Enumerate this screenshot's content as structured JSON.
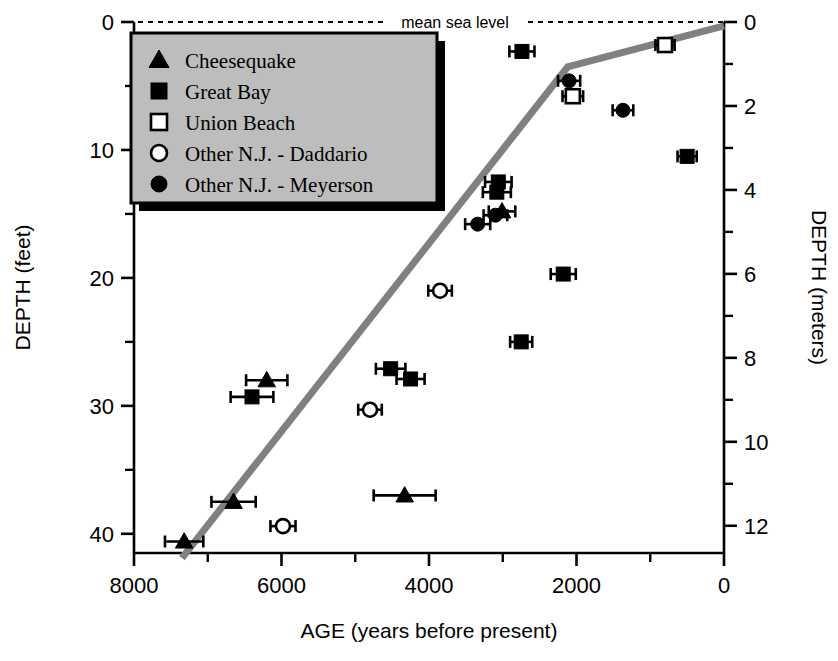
{
  "chart_data": {
    "type": "scatter",
    "title": "",
    "xlabel": "AGE (years before present)",
    "ylabel": "DEPTH (feet)",
    "ylabel_right": "DEPTH (meters)",
    "xlim": [
      8000,
      0
    ],
    "ylim": [
      0,
      41.5
    ],
    "ylim_right": [
      0,
      12.65
    ],
    "x_reversed": true,
    "y_inverted": true,
    "grid": false,
    "legend_position": "top-left",
    "x_ticks_major": [
      8000,
      6000,
      4000,
      2000,
      0
    ],
    "x_tick_labels": [
      "8000",
      "6000",
      "4000",
      "2000",
      "0"
    ],
    "x_ticks_minor": [
      7000,
      5000,
      3000,
      1000
    ],
    "y_ticks_major": [
      0,
      10,
      20,
      30,
      40
    ],
    "y_tick_labels": [
      "0",
      "10",
      "20",
      "30",
      "40"
    ],
    "y_ticks_minor": [
      5,
      15,
      25,
      35
    ],
    "y_right_ticks_major": [
      0,
      2,
      4,
      6,
      8,
      10,
      12
    ],
    "y_right_tick_labels": [
      "0",
      "2",
      "4",
      "6",
      "8",
      "10",
      "12"
    ],
    "y_right_ticks_minor": [
      1,
      3,
      5,
      7,
      9,
      11
    ],
    "annotations": [
      {
        "name": "mean-sea-level",
        "text": "mean sea level",
        "y_feet": 0,
        "style": "dashed-line"
      }
    ],
    "trend_line": {
      "name": "sea-level-curve",
      "color": "#808080",
      "width_px": 7,
      "points": [
        {
          "age": 7350,
          "depth_feet": 41.9
        },
        {
          "age": 2120,
          "depth_feet": 3.5
        },
        {
          "age": 0,
          "depth_feet": 0.3
        }
      ]
    },
    "series": [
      {
        "name": "Cheesequake",
        "marker": "triangle",
        "filled": true,
        "color": "#000000",
        "points": [
          {
            "age": 7320,
            "depth_feet": 40.6,
            "x_err": 260
          },
          {
            "age": 6650,
            "depth_feet": 37.5,
            "x_err": 300
          },
          {
            "age": 4330,
            "depth_feet": 37.0,
            "x_err": 420
          },
          {
            "age": 6200,
            "depth_feet": 28.0,
            "x_err": 280
          },
          {
            "age": 3010,
            "depth_feet": 14.8,
            "x_err": 180
          }
        ]
      },
      {
        "name": "Great Bay",
        "marker": "square",
        "filled": true,
        "color": "#000000",
        "points": [
          {
            "age": 2740,
            "depth_feet": 2.3,
            "x_err": 170
          },
          {
            "age": 500,
            "depth_feet": 10.5,
            "x_err": 130
          },
          {
            "age": 2180,
            "depth_feet": 19.7,
            "x_err": 170
          },
          {
            "age": 2750,
            "depth_feet": 25.0,
            "x_err": 150
          },
          {
            "age": 4520,
            "depth_feet": 27.1,
            "x_err": 200
          },
          {
            "age": 6400,
            "depth_feet": 29.3,
            "x_err": 290
          },
          {
            "age": 4250,
            "depth_feet": 27.9,
            "x_err": 190
          },
          {
            "age": 3060,
            "depth_feet": 12.5,
            "x_err": 180
          },
          {
            "age": 3080,
            "depth_feet": 13.3,
            "x_err": 190
          }
        ]
      },
      {
        "name": "Union Beach",
        "marker": "square",
        "filled": false,
        "color": "#000000",
        "points": [
          {
            "age": 800,
            "depth_feet": 1.8,
            "x_err": 130
          },
          {
            "age": 2050,
            "depth_feet": 5.8,
            "x_err": 140
          }
        ]
      },
      {
        "name": "Other N.J. - Daddario",
        "marker": "circle",
        "filled": false,
        "color": "#000000",
        "points": [
          {
            "age": 3850,
            "depth_feet": 21.0,
            "x_err": 160
          },
          {
            "age": 4800,
            "depth_feet": 30.3,
            "x_err": 160
          },
          {
            "age": 5980,
            "depth_feet": 39.4,
            "x_err": 170
          }
        ]
      },
      {
        "name": "Other N.J. - Meyerson",
        "marker": "circle",
        "filled": true,
        "color": "#000000",
        "points": [
          {
            "age": 2100,
            "depth_feet": 4.6,
            "x_err": 150
          },
          {
            "age": 1370,
            "depth_feet": 6.9,
            "x_err": 140
          },
          {
            "age": 3100,
            "depth_feet": 15.1,
            "x_err": 160
          },
          {
            "age": 3340,
            "depth_feet": 15.8,
            "x_err": 170
          }
        ]
      }
    ],
    "legend_entries": [
      {
        "label": "Cheesequake",
        "marker": "triangle",
        "filled": true
      },
      {
        "label": "Great Bay",
        "marker": "square",
        "filled": true
      },
      {
        "label": "Union Beach",
        "marker": "square",
        "filled": false
      },
      {
        "label": "Other N.J. - Daddario",
        "marker": "circle",
        "filled": false
      },
      {
        "label": "Other N.J. - Meyerson",
        "marker": "circle",
        "filled": true
      }
    ],
    "legend_style": {
      "background": "#bdbdbd",
      "border": "#000000",
      "shadow": "#000000"
    }
  }
}
